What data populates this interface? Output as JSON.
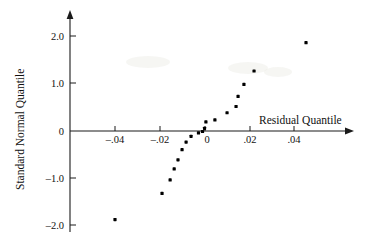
{
  "chart_data": {
    "type": "scatter",
    "title": "",
    "subtitle": "",
    "xlabel": "Residual Quantile",
    "ylabel": "Standard Normal Quantile",
    "xlim": [
      -0.056,
      0.054
    ],
    "ylim": [
      -2.45,
      2.35
    ],
    "grid": false,
    "legend": null,
    "x_ticks": [
      -0.04,
      -0.02,
      0,
      0.02,
      0.04
    ],
    "x_tick_labels": [
      "–.04",
      "–.02",
      "0",
      ".02",
      ".04"
    ],
    "y_ticks": [
      2.0,
      1.0,
      0,
      -1.0,
      -2.0
    ],
    "y_tick_labels": [
      "2.0",
      "1.0",
      "0",
      "–1.0",
      "–2.0"
    ],
    "point_color": "#000000",
    "axis_color": "#1a1a1a",
    "series": [
      {
        "name": "residuals",
        "x": [
          -0.04,
          -0.0191,
          -0.0155,
          -0.0137,
          -0.012,
          -0.0102,
          -0.0084,
          -0.0062,
          -0.0029,
          -0.0011,
          -0.0002,
          0.0004,
          0.0044,
          0.0098,
          0.0138,
          0.0147,
          0.0173,
          0.0218,
          0.0449
        ],
        "y": [
          -1.845,
          -1.3,
          -1.02,
          -0.79,
          -0.6,
          -0.39,
          -0.23,
          -0.11,
          -0.04,
          -0.01,
          0.055,
          0.19,
          0.23,
          0.38,
          0.51,
          0.72,
          0.97,
          1.25,
          1.84
        ]
      }
    ]
  },
  "axes": {
    "x_title": "Residual Quantile",
    "y_title": "Standard Normal Quantile"
  }
}
